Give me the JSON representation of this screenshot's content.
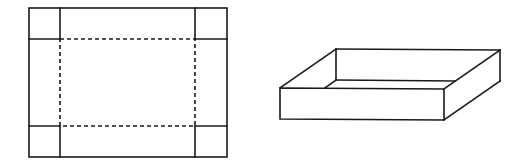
{
  "figure": {
    "stroke_color": "#1a1a1a",
    "background": "#ffffff",
    "net": {
      "label": "",
      "outer": {
        "x1": 29,
        "y1": 8,
        "x2": 227,
        "y2": 157
      },
      "inner": {
        "x1": 60,
        "y1": 39,
        "x2": 195,
        "y2": 126
      },
      "fold_lines": "dashed"
    },
    "box": {
      "label": "",
      "front_face": {
        "x1": 280,
        "y1": 88,
        "x2": 444,
        "y2": 120
      },
      "depth_offset": {
        "dx": 56,
        "dy": -39
      }
    }
  }
}
